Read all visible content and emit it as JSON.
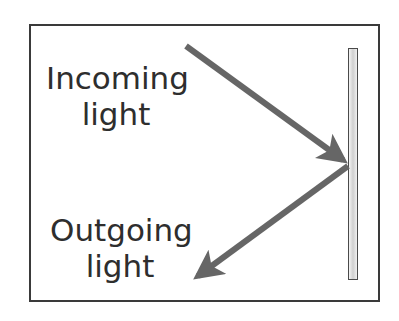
{
  "diagram": {
    "incoming_label": [
      "Incoming",
      "light"
    ],
    "outgoing_label": [
      "Outgoing",
      "light"
    ],
    "colors": {
      "frame": "#3a3a3a",
      "arrow": "#666666",
      "text": "#2e2e2e",
      "mirror_border": "#4a4a4a"
    },
    "incoming_arrow": {
      "from": [
        186,
        46
      ],
      "to": [
        348,
        164
      ]
    },
    "outgoing_arrow": {
      "from": [
        348,
        164
      ],
      "to": [
        192,
        280
      ]
    }
  }
}
